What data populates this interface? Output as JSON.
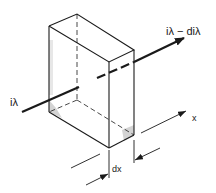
{
  "diagram": {
    "labels": {
      "incident_intensity": "iλ",
      "exiting_intensity": "iλ − diλ",
      "axis": "x",
      "thickness": "dx"
    },
    "colors": {
      "ink": "#1a1a1a",
      "shading": "#9a9a9a",
      "background": "#ffffff"
    }
  }
}
